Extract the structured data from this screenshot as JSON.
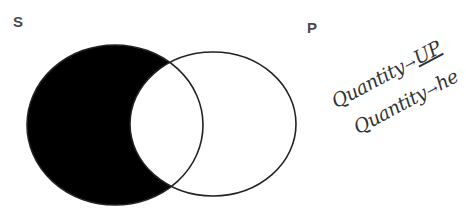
{
  "diagram": {
    "type": "venn",
    "sets": [
      {
        "id": "S",
        "label": "S",
        "shape": {
          "cx": 115,
          "cy": 125,
          "rx": 88,
          "ry": 80
        },
        "region_shaded": "S-only",
        "fill": "#000000"
      },
      {
        "id": "P",
        "label": "P",
        "shape": {
          "cx": 213,
          "cy": 124,
          "rx": 83,
          "ry": 72
        },
        "fill": "none",
        "stroke": "#222222"
      }
    ],
    "shaded_region": "S minus P",
    "colors": {
      "shade": "#000000",
      "outline": "#222222",
      "background": "#ffffff",
      "label": "#4a4a4a",
      "handwriting": "#333333"
    }
  },
  "annotation": {
    "lines": [
      {
        "word": "Quantity",
        "arrow": "→",
        "value": "UP",
        "underlined": true
      },
      {
        "word": "Quantity",
        "arrow": "→",
        "value": "he",
        "underlined": false
      }
    ]
  }
}
